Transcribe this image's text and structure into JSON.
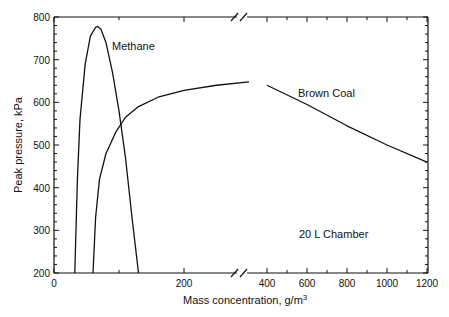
{
  "chart_data": {
    "type": "line",
    "title": "",
    "xlabel": "Mass concentration, g/m³",
    "ylabel": "Peak pressure, kPa",
    "annotation": "20 L Chamber",
    "xlim": [
      0,
      1200
    ],
    "ylim": [
      200,
      800
    ],
    "axis_break": {
      "from": 300,
      "to": 350
    },
    "x_ticks": [
      "0",
      "200",
      "400",
      "600",
      "800",
      "1000",
      "1200"
    ],
    "y_ticks": [
      "200",
      "300",
      "400",
      "500",
      "600",
      "700",
      "800"
    ],
    "grid": false,
    "series": [
      {
        "name": "Methane",
        "x": [
          32,
          36,
          40,
          48,
          56,
          64,
          67,
          72,
          80,
          90,
          100,
          110,
          120,
          130
        ],
        "y": [
          200,
          420,
          560,
          690,
          755,
          776,
          778,
          772,
          740,
          670,
          580,
          470,
          330,
          200
        ]
      },
      {
        "name": "Brown Coal",
        "x": [
          60,
          64,
          70,
          80,
          95,
          110,
          130,
          160,
          200,
          250,
          300,
          400,
          600,
          800,
          1000,
          1200
        ],
        "y": [
          200,
          330,
          420,
          480,
          530,
          565,
          590,
          612,
          628,
          640,
          648,
          640,
          595,
          545,
          500,
          460
        ]
      }
    ]
  },
  "labels": {
    "methane": "Methane",
    "brown_coal": "Brown Coal",
    "chamber": "20 L Chamber",
    "xlabel": "Mass concentration, g/m",
    "xlabel_sup": "3",
    "ylabel": "Peak pressure, kPa"
  }
}
